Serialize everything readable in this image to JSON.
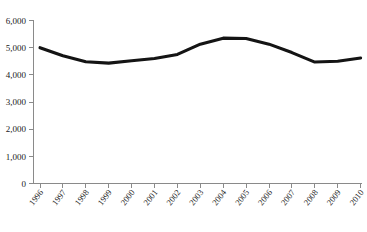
{
  "chart_data": {
    "type": "line",
    "title": "",
    "subtitle": "",
    "xlabel": "",
    "ylabel": "",
    "grid": false,
    "legend": false,
    "legend_position": "none",
    "line_color": "#141414",
    "axis_color": "#8a8a8a",
    "xlim_categories": [
      "1996",
      "1997",
      "1998",
      "1999",
      "2000",
      "2001",
      "2002",
      "2003",
      "2004",
      "2005",
      "2006",
      "2007",
      "2008",
      "2009",
      "2010"
    ],
    "ylim": [
      0,
      6000
    ],
    "y_tick_step": 1000,
    "categories": [
      "1996",
      "1997",
      "1998",
      "1999",
      "2000",
      "2001",
      "2002",
      "2003",
      "2004",
      "2005",
      "2006",
      "2007",
      "2008",
      "2009",
      "2010"
    ],
    "values": [
      5000,
      4700,
      4480,
      4430,
      4520,
      4600,
      4750,
      5130,
      5350,
      5340,
      5130,
      4820,
      4470,
      4500,
      4620
    ],
    "y_tick_labels": [
      "0",
      "1,000",
      "2,000",
      "3,000",
      "4,000",
      "5,000",
      "6,000"
    ],
    "y_tick_values": [
      0,
      1000,
      2000,
      3000,
      4000,
      5000,
      6000
    ],
    "x_tick_labels": [
      "1996",
      "1997",
      "1998",
      "1999",
      "2000",
      "2001",
      "2002",
      "2003",
      "2004",
      "2005",
      "2006",
      "2007",
      "2008",
      "2009",
      "2010"
    ]
  }
}
